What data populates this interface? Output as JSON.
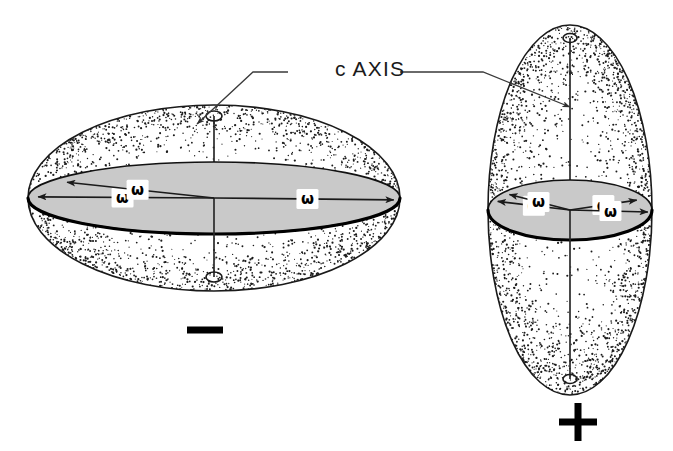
{
  "figure": {
    "title_label": "c AXIS",
    "background_color": "#ffffff",
    "ink_color": "#1a1a1a",
    "disk_fill_color": "#c9c9c9",
    "axis_label": {
      "text": "c AXIS",
      "x": 335,
      "y": 70
    },
    "indicatrices": [
      {
        "name": "negative-uniaxial-indicatrix",
        "form": "oblate",
        "sign_label": "−",
        "sign_name": "minus-sign",
        "sign_x": 205,
        "sign_y": 330,
        "center_x": 214,
        "center_y": 198,
        "radius_x": 186,
        "radius_y": 93,
        "disk_radius_x": 186,
        "disk_radius_y": 36,
        "axis_top_y": 116,
        "axis_bottom_y": 277,
        "cap_radius_x": 8,
        "cap_radius_y": 5,
        "omega_arrows": [
          {
            "label": "ω",
            "angle_deg": 182,
            "length": 176,
            "label_t": 0.52
          },
          {
            "label": "ω",
            "angle_deg": 209,
            "length": 168,
            "label_t": 0.52
          },
          {
            "label": "ω",
            "angle_deg": 3,
            "length": 180,
            "label_t": 0.52
          }
        ]
      },
      {
        "name": "positive-uniaxial-indicatrix",
        "form": "prolate",
        "sign_label": "+",
        "sign_name": "plus-sign",
        "sign_x": 578,
        "sign_y": 422,
        "center_x": 570,
        "center_y": 210,
        "radius_x": 82,
        "radius_y": 185,
        "disk_radius_x": 82,
        "disk_radius_y": 30,
        "axis_top_y": 38,
        "axis_bottom_y": 379,
        "cap_radius_x": 7,
        "cap_radius_y": 4.5,
        "omega_arrows": [
          {
            "label": "ω",
            "angle_deg": 198,
            "length": 76,
            "label_t": 0.5
          },
          {
            "label": "ω",
            "angle_deg": 215,
            "length": 74,
            "label_t": 0.52
          },
          {
            "label": "ω",
            "angle_deg": 338,
            "length": 72,
            "label_t": 0.5
          },
          {
            "label": "ω",
            "angle_deg": 4,
            "length": 78,
            "label_t": 0.52
          }
        ]
      }
    ],
    "leaders": [
      {
        "name": "leader-left",
        "points": "288,72 253,72 197,124",
        "arrow_at": "197,124",
        "arrow_angle_deg": 137
      },
      {
        "name": "leader-right",
        "points": "400,72 483,72 570,107",
        "arrow_at": "570,107",
        "arrow_angle_deg": 22
      }
    ]
  }
}
